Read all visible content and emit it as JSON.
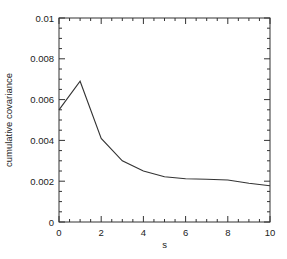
{
  "chart_data": {
    "type": "line",
    "title": "",
    "xlabel": "s",
    "ylabel": "cumulative covariance",
    "xlim": [
      0,
      10
    ],
    "ylim": [
      0,
      0.01
    ],
    "grid": false,
    "legend": null,
    "x_ticks": [
      0,
      2,
      4,
      6,
      8,
      10
    ],
    "x_tick_labels": [
      "0",
      "2",
      "4",
      "6",
      "8",
      "10"
    ],
    "y_ticks": [
      0,
      0.002,
      0.004,
      0.006,
      0.008,
      0.01
    ],
    "y_tick_labels": [
      "0",
      "0.002",
      "0.004",
      "0.006",
      "0.008",
      "0.01"
    ],
    "x_minor_step": 0.5,
    "y_minor_step": 0.0005,
    "series": [
      {
        "name": "cumulative covariance",
        "color": "#333333",
        "x": [
          0,
          1,
          2,
          3,
          4,
          5,
          6,
          7,
          8,
          9,
          10
        ],
        "values": [
          0.0055,
          0.0069,
          0.0041,
          0.003,
          0.0025,
          0.00222,
          0.00212,
          0.0021,
          0.00206,
          0.0019,
          0.00178
        ]
      }
    ]
  }
}
